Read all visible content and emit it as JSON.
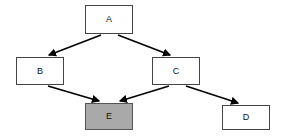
{
  "diagram": {
    "canvas": {
      "width": 283,
      "height": 139,
      "background": "#ffffff"
    },
    "style": {
      "node_fill": "#ffffff",
      "node_stroke": "#444444",
      "highlight_fill": "#a9a9a9",
      "highlight_stroke": "#555555",
      "edge_color": "#000000",
      "label_color": "#111111"
    },
    "nodes": [
      {
        "id": "A",
        "label": "A",
        "x": 85,
        "y": 5,
        "w": 48,
        "h": 29,
        "highlighted": false
      },
      {
        "id": "B",
        "label": "B",
        "x": 16,
        "y": 57,
        "w": 48,
        "h": 28,
        "highlighted": false
      },
      {
        "id": "C",
        "label": "C",
        "x": 152,
        "y": 57,
        "w": 48,
        "h": 28,
        "highlighted": false
      },
      {
        "id": "E",
        "label": "E",
        "x": 85,
        "y": 103,
        "w": 48,
        "h": 27,
        "highlighted": true
      },
      {
        "id": "D",
        "label": "D",
        "x": 222,
        "y": 105,
        "w": 48,
        "h": 25,
        "highlighted": false
      }
    ],
    "edges": [
      {
        "from": "A",
        "to": "B",
        "x1": 101,
        "y1": 35,
        "x2": 49,
        "y2": 55
      },
      {
        "from": "A",
        "to": "C",
        "x1": 118,
        "y1": 35,
        "x2": 170,
        "y2": 55
      },
      {
        "from": "B",
        "to": "E",
        "x1": 48,
        "y1": 86,
        "x2": 99,
        "y2": 101
      },
      {
        "from": "C",
        "to": "E",
        "x1": 169,
        "y1": 86,
        "x2": 120,
        "y2": 101
      },
      {
        "from": "C",
        "to": "D",
        "x1": 186,
        "y1": 86,
        "x2": 238,
        "y2": 103
      }
    ]
  }
}
